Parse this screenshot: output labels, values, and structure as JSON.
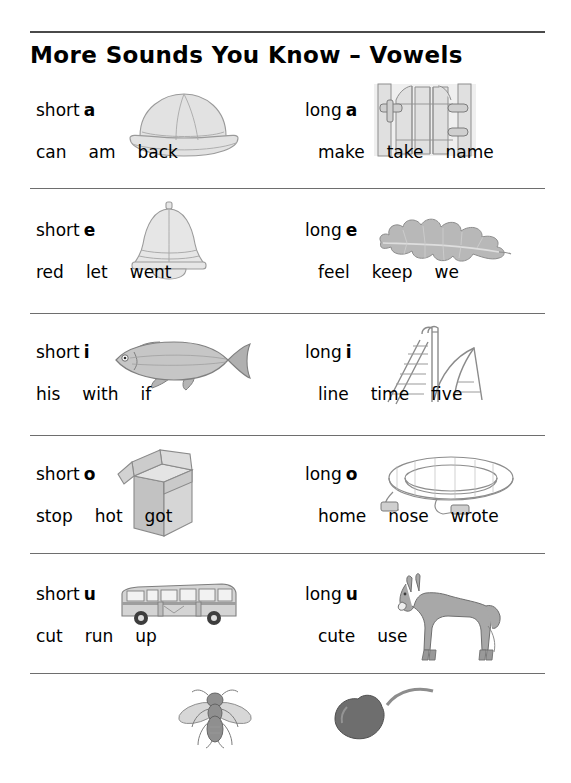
{
  "document": {
    "title": "More Sounds You Know – Vowels"
  },
  "rows": [
    {
      "id": "a",
      "left": {
        "length_label": "short",
        "vowel": "a",
        "picture": "pith-helmet-hat-icon",
        "words": [
          "can",
          "am",
          "back"
        ]
      },
      "right": {
        "length_label": "long",
        "vowel": "a",
        "picture": "garden-gate-icon",
        "words": [
          "make",
          "take",
          "name"
        ]
      }
    },
    {
      "id": "e",
      "left": {
        "length_label": "short",
        "vowel": "e",
        "picture": "bell-icon",
        "words": [
          "red",
          "let",
          "went"
        ]
      },
      "right": {
        "length_label": "long",
        "vowel": "e",
        "picture": "oak-leaf-icon",
        "words": [
          "feel",
          "keep",
          "we"
        ]
      }
    },
    {
      "id": "i",
      "left": {
        "length_label": "short",
        "vowel": "i",
        "picture": "fish-icon",
        "words": [
          "his",
          "with",
          "if"
        ]
      },
      "right": {
        "length_label": "long",
        "vowel": "i",
        "picture": "playground-slide-icon",
        "words": [
          "line",
          "time",
          "five"
        ]
      }
    },
    {
      "id": "o",
      "left": {
        "length_label": "short",
        "vowel": "o",
        "picture": "cardboard-box-icon",
        "words": [
          "stop",
          "hot",
          "got"
        ]
      },
      "right": {
        "length_label": "long",
        "vowel": "o",
        "picture": "garden-hose-icon",
        "words": [
          "home",
          "nose",
          "wrote"
        ]
      }
    },
    {
      "id": "u",
      "left": {
        "length_label": "short",
        "vowel": "u",
        "picture": "bus-icon",
        "words": [
          "cut",
          "run",
          "up"
        ]
      },
      "right": {
        "length_label": "long",
        "vowel": "u",
        "picture": "mule-icon",
        "words": [
          "cute",
          "use"
        ]
      }
    }
  ],
  "y_row": {
    "left_picture": "fly-insect-icon",
    "dash": "—",
    "letter": "y",
    "right_picture": "cherry-icon"
  },
  "colors": {
    "text": "#000000",
    "rule": "#6e6e6e",
    "rule_top": "#4a4a4a",
    "artwork_line": "#8a8a8a",
    "artwork_fill": "#d8d8d8",
    "cherry_fill": "#707070",
    "page_background": "#ffffff"
  }
}
